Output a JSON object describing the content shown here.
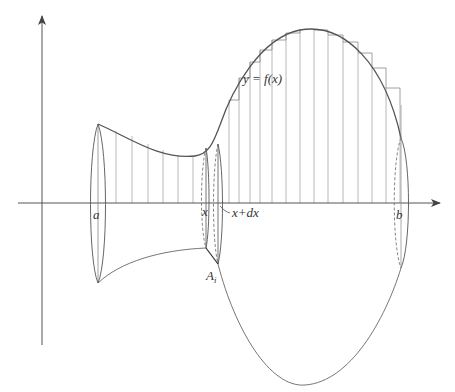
{
  "figure": {
    "labels": {
      "curve": "y = f(x)",
      "a": "a",
      "b": "b",
      "x": "x",
      "x_plus_dx": "x+dx",
      "area": "A",
      "area_sub": "i"
    },
    "colors": {
      "axis": "#555555",
      "curve": "#555555",
      "strips": "#aaaaaa",
      "text": "#333333"
    }
  }
}
